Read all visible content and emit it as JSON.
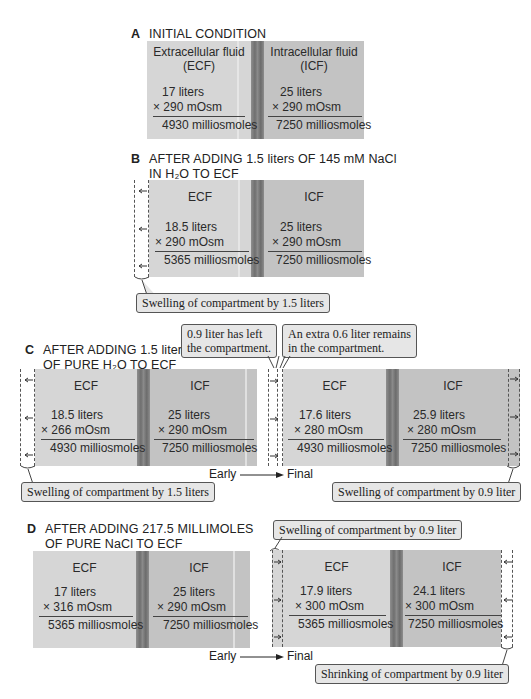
{
  "panel_a": {
    "letter": "A",
    "title": "INITIAL CONDITION",
    "ecf": {
      "label_line1": "Extracellular fluid",
      "label_line2": "(ECF)",
      "volume": "17 liters",
      "osm": "×  290 mOsm",
      "total": "4930 milliosmoles"
    },
    "icf": {
      "label_line1": "Intracellular fluid",
      "label_line2": "(ICF)",
      "volume": "25 liters",
      "osm": "× 290 mOsm",
      "total": "7250 milliosmoles"
    }
  },
  "panel_b": {
    "letter": "B",
    "title_line1": "AFTER ADDING 1.5 liters OF 145 mM NaCl",
    "title_line2": "IN H₂O TO ECF",
    "ecf": {
      "label": "ECF",
      "volume": "18.5 liters",
      "osm": "×  290 mOsm",
      "total": "5365 milliosmoles"
    },
    "icf": {
      "label": "ICF",
      "volume": "25 liters",
      "osm": "× 290 mOsm",
      "total": "7250 milliosmoles"
    },
    "callout": "Swelling of compartment by 1.5 liters"
  },
  "panel_c": {
    "letter": "C",
    "title_line1": "AFTER ADDING 1.5 liters",
    "title_line2": "OF PURE H₂O TO ECF",
    "early": {
      "ecf": {
        "label": "ECF",
        "volume": "18.5 liters",
        "osm": "× 266 mOsm",
        "total": "4930 milliosmoles"
      },
      "icf": {
        "label": "ICF",
        "volume": "25 liters",
        "osm": "× 290 mOsm",
        "total": "7250 milliosmoles"
      },
      "callout": "Swelling of compartment by 1.5 liters"
    },
    "final": {
      "ecf": {
        "label": "ECF",
        "volume": "17.6 liters",
        "osm": "× 280 mOsm",
        "total": "4930 milliosmoles"
      },
      "icf": {
        "label": "ICF",
        "volume": "25.9 liters",
        "osm": "× 280 mOsm",
        "total": "7250 milliosmoles"
      },
      "callout": "Swelling of compartment by 0.9 liter"
    },
    "callout_left_line1": "0.9 liter has left",
    "callout_left_line2": "the  compartment.",
    "callout_right_line1": "An extra 0.6 liter remains",
    "callout_right_line2": "in the compartment.",
    "early_label": "Early",
    "final_label": "Final"
  },
  "panel_d": {
    "letter": "D",
    "title_line1": "AFTER ADDING 217.5 MILLIMOLES",
    "title_line2": "OF PURE NaCl TO ECF",
    "early": {
      "ecf": {
        "label": "ECF",
        "volume": "17 liters",
        "osm": "× 316 mOsm",
        "total": "5365 milliosmoles"
      },
      "icf": {
        "label": "ICF",
        "volume": "25 liters",
        "osm": "× 290 mOsm",
        "total": "7250 milliosmoles"
      }
    },
    "final": {
      "ecf": {
        "label": "ECF",
        "volume": "17.9 liters",
        "osm": "× 300 mOsm",
        "total": "5365 milliosmoles"
      },
      "icf": {
        "label": "ICF",
        "volume": "24.1 liters",
        "osm": "× 300 mOsm",
        "total": "7250 milliosmoles"
      },
      "callout_top": "Swelling of compartment by 0.9 liter",
      "callout_bottom": "Shrinking of compartment by 0.9 liter"
    },
    "early_label": "Early",
    "final_label": "Final"
  },
  "colors": {
    "ecf": "#d6d6d6",
    "icf": "#c3c3c3",
    "membrane": "#7a7a7a",
    "callout_bg": "#e6e6e6"
  }
}
